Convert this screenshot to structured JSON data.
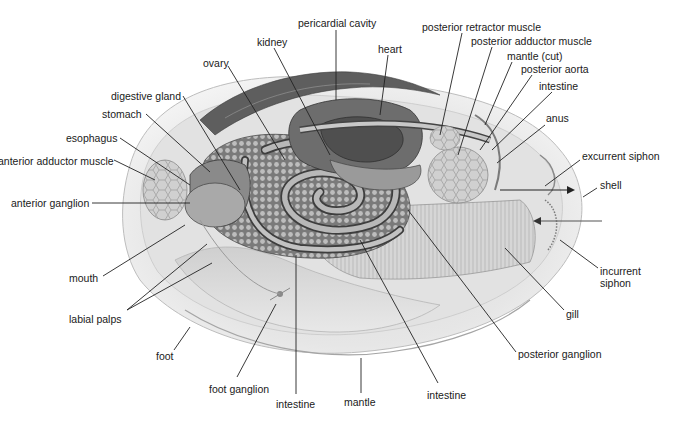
{
  "diagram": {
    "colors": {
      "background": "#ffffff",
      "label_text": "#1a1a1a",
      "leader_line": "#222222"
    },
    "labels": [
      {
        "id": "pericardial-cavity",
        "text": "pericardial cavity",
        "x": 298,
        "y": 23
      },
      {
        "id": "kidney",
        "text": "kidney",
        "x": 257,
        "y": 36
      },
      {
        "id": "heart",
        "text": "heart",
        "x": 378,
        "y": 43
      },
      {
        "id": "ovary",
        "text": "ovary",
        "x": 203,
        "y": 57
      },
      {
        "id": "digestive-gland",
        "text": "digestive gland",
        "x": 111,
        "y": 90
      },
      {
        "id": "stomach",
        "text": "stomach",
        "x": 102,
        "y": 108
      },
      {
        "id": "esophagus",
        "text": "esophagus",
        "x": 66,
        "y": 132
      },
      {
        "id": "anterior-adductor-muscle",
        "text": "anterior adductor muscle",
        "x": -2,
        "y": 155
      },
      {
        "id": "anterior-ganglion",
        "text": "anterior ganglion",
        "x": 11,
        "y": 197
      },
      {
        "id": "posterior-retractor-muscle",
        "text": "posterior retractor muscle",
        "x": 422,
        "y": 21
      },
      {
        "id": "posterior-adductor-muscle",
        "text": "posterior adductor muscle",
        "x": 471,
        "y": 35
      },
      {
        "id": "mantle-cut",
        "text": "mantle (cut)",
        "x": 507,
        "y": 50
      },
      {
        "id": "posterior-aorta",
        "text": "posterior aorta",
        "x": 521,
        "y": 63
      },
      {
        "id": "intestine-upper",
        "text": "intestine",
        "x": 539,
        "y": 80
      },
      {
        "id": "anus",
        "text": "anus",
        "x": 546,
        "y": 112
      },
      {
        "id": "excurrent-siphon",
        "text": "excurrent siphon",
        "x": 582,
        "y": 150
      },
      {
        "id": "shell",
        "text": "shell",
        "x": 600,
        "y": 179
      },
      {
        "id": "incurrent-siphon",
        "text": "incurrent\nsiphon",
        "x": 600,
        "y": 265
      },
      {
        "id": "gill",
        "text": "gill",
        "x": 566,
        "y": 308
      },
      {
        "id": "mouth",
        "text": "mouth",
        "x": 69,
        "y": 272
      },
      {
        "id": "labial-palps",
        "text": "labial palps",
        "x": 69,
        "y": 313
      },
      {
        "id": "foot",
        "text": "foot",
        "x": 156,
        "y": 350
      },
      {
        "id": "foot-ganglion",
        "text": "foot ganglion",
        "x": 209,
        "y": 383
      },
      {
        "id": "intestine-lower-left",
        "text": "intestine",
        "x": 276,
        "y": 398
      },
      {
        "id": "mantle",
        "text": "mantle",
        "x": 344,
        "y": 396
      },
      {
        "id": "intestine-lower-right",
        "text": "intestine",
        "x": 427,
        "y": 389
      },
      {
        "id": "posterior-ganglion",
        "text": "posterior ganglion",
        "x": 518,
        "y": 348
      }
    ],
    "arrows": [
      {
        "id": "excurrent-flow-arrow",
        "direction": "out",
        "from": [
          500,
          190
        ],
        "to": [
          575,
          190
        ]
      },
      {
        "id": "incurrent-flow-arrow",
        "direction": "in",
        "from": [
          602,
          221
        ],
        "to": [
          533,
          221
        ]
      }
    ]
  }
}
